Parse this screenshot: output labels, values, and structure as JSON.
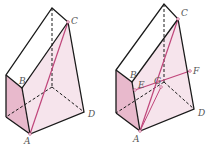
{
  "colors": {
    "edge": "#1a1a1a",
    "accent": "#c0457a",
    "face_light": "#f6e4ec",
    "face_dark": "#e8b9cc",
    "label": "#555555"
  },
  "figures": [
    {
      "id": "left",
      "labels": {
        "A": "A",
        "B": "B",
        "C": "C",
        "D": "D"
      }
    },
    {
      "id": "right",
      "labels": {
        "A": "A",
        "B": "B",
        "C": "C",
        "D": "D",
        "E": "E",
        "F": "F",
        "G": "G"
      }
    }
  ]
}
